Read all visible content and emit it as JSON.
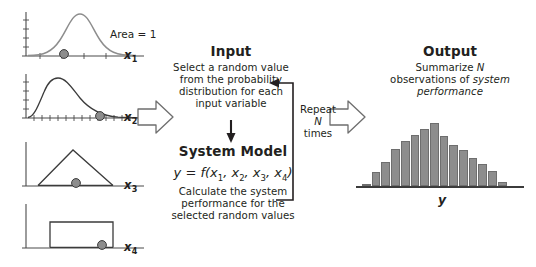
{
  "diagram": {
    "accent_color": "#8d8d8d",
    "line_color": "#231f20"
  },
  "inputs": {
    "area_note": "Area = 1",
    "plots": [
      {
        "name": "normal-distribution",
        "label": "x",
        "subscript": "1",
        "shape": "bell-curve",
        "sample_marker_x_fraction": 0.36
      },
      {
        "name": "lognormal-distribution",
        "label": "x",
        "subscript": "2",
        "shape": "right-skewed-curve",
        "sample_marker_x_fraction": 0.66
      },
      {
        "name": "triangular-distribution",
        "label": "x",
        "subscript": "3",
        "shape": "triangle",
        "sample_marker_x_fraction": 0.5
      },
      {
        "name": "uniform-distribution",
        "label": "x",
        "subscript": "4",
        "shape": "rectangle",
        "sample_marker_x_fraction": 0.76
      }
    ]
  },
  "input_block": {
    "title": "Input",
    "line1": "Select a random value",
    "line2": "from the probability",
    "line3": "distribution for each",
    "line4": "input variable"
  },
  "model_block": {
    "title": "System Model",
    "formula_lead": "y",
    "formula_eq": " = ",
    "formula_fn": "f",
    "formula_args": "(x1, x2, x3, x4)",
    "line1": "Calculate the system",
    "line2": "performance for the",
    "line3": "selected random values"
  },
  "loop": {
    "line1": "Repeat",
    "line2": "N",
    "line3": "times"
  },
  "output_block": {
    "title": "Output",
    "line1_pre": "Summarize ",
    "line1_em": "N",
    "line2_pre": "observations of ",
    "line2_em": "system",
    "line3_em": "performance"
  },
  "chart_data": {
    "type": "bar",
    "xlabel": "y",
    "ylabel": "",
    "grid": false,
    "legend": "none",
    "categories": [
      "b1",
      "b2",
      "b3",
      "b4",
      "b5",
      "b6",
      "b7",
      "b8",
      "b9",
      "b10",
      "b11",
      "b12",
      "b13",
      "b14",
      "b15",
      "b16",
      "b17"
    ],
    "values": [
      2,
      14,
      24,
      37,
      45,
      51,
      57,
      63,
      50,
      41,
      36,
      28,
      22,
      15,
      4,
      0,
      0
    ],
    "ylim": [
      0,
      66
    ]
  }
}
